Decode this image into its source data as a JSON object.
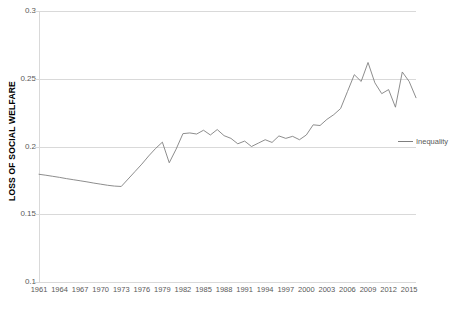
{
  "chart_data": {
    "type": "line",
    "title": "",
    "xlabel": "",
    "ylabel": "LOSS OF SOCIAL WELFARE",
    "ylim": [
      0.1,
      0.3
    ],
    "yticks": [
      0.1,
      0.15,
      0.2,
      0.25,
      0.3
    ],
    "ytick_labels": [
      "0.1",
      "0.15",
      "0.2",
      "0.25",
      "0.3"
    ],
    "grid": true,
    "legend_position": "right",
    "legend": [
      "Inequality"
    ],
    "xlim": [
      1961,
      2016
    ],
    "xticks": [
      1961,
      1964,
      1967,
      1970,
      1973,
      1976,
      1979,
      1982,
      1985,
      1988,
      1991,
      1994,
      1997,
      2000,
      2003,
      2006,
      2009,
      2012,
      2015
    ],
    "xtick_labels": [
      "1961",
      "1964",
      "1967",
      "1970",
      "1973",
      "1976",
      "1979",
      "1982",
      "1985",
      "1988",
      "1991",
      "1994",
      "1997",
      "2000",
      "2003",
      "2006",
      "2009",
      "2012",
      "2015"
    ],
    "x": [
      1961,
      1962,
      1963,
      1964,
      1965,
      1966,
      1967,
      1968,
      1969,
      1970,
      1971,
      1972,
      1973,
      1974,
      1975,
      1976,
      1977,
      1978,
      1979,
      1980,
      1981,
      1982,
      1983,
      1984,
      1985,
      1986,
      1987,
      1988,
      1989,
      1990,
      1991,
      1992,
      1993,
      1994,
      1995,
      1996,
      1997,
      1998,
      1999,
      2000,
      2001,
      2002,
      2003,
      2004,
      2005,
      2006,
      2007,
      2008,
      2009,
      2010,
      2011,
      2012,
      2013,
      2014,
      2015,
      2016
    ],
    "series": [
      {
        "name": "Inequality",
        "color": "#808080",
        "values": [
          0.1795,
          0.1788,
          0.178,
          0.1772,
          0.1763,
          0.1755,
          0.1747,
          0.1739,
          0.173,
          0.1722,
          0.1714,
          0.1708,
          0.1705,
          0.176,
          0.1815,
          0.187,
          0.193,
          0.1985,
          0.2032,
          0.188,
          0.198,
          0.2095,
          0.21,
          0.2092,
          0.212,
          0.2085,
          0.2125,
          0.208,
          0.206,
          0.202,
          0.204,
          0.2,
          0.2025,
          0.205,
          0.203,
          0.2078,
          0.206,
          0.2075,
          0.205,
          0.2085,
          0.216,
          0.2155,
          0.22,
          0.2235,
          0.228,
          0.2405,
          0.253,
          0.248,
          0.262,
          0.247,
          0.239,
          0.242,
          0.229,
          0.255,
          0.248,
          0.236
        ]
      }
    ]
  },
  "legend": {
    "label": "Inequality"
  },
  "axes": {
    "y_title": "LOSS OF SOCIAL WELFARE"
  }
}
